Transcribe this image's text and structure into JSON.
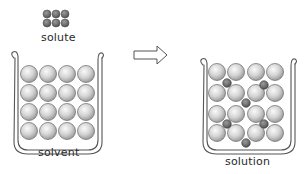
{
  "diagram": {
    "labels": {
      "solute": "solute",
      "solvent": "solvent",
      "solution": "solution"
    },
    "caption_partial": "",
    "colors": {
      "solvent_particle": "#d6d6d6",
      "solvent_particle_highlight": "#f4f4f4",
      "solute_particle": "#6e6e6e",
      "outline": "#555555",
      "background": "#ffffff"
    },
    "solute_group": {
      "rows": 2,
      "cols": 3
    },
    "solvent_beaker": {
      "rows": 4,
      "cols": 4,
      "particle": "solvent"
    },
    "solution_beaker": {
      "rows": 4,
      "cols": 4,
      "solvent_particles": 16,
      "solute_particles": 6
    },
    "arrow": {
      "direction": "right",
      "meaning": "dissolves into"
    }
  }
}
